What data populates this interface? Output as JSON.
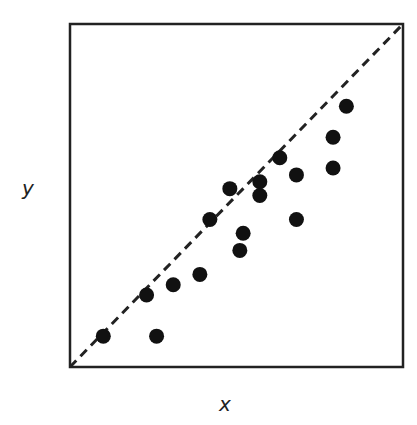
{
  "chart_data": {
    "type": "scatter",
    "title": "",
    "xlabel": "x",
    "ylabel": "y",
    "xlim": [
      0,
      10
    ],
    "ylim": [
      0,
      10
    ],
    "grid": false,
    "ticks": false,
    "reference_line": {
      "style": "dashed",
      "from": [
        0,
        0
      ],
      "to": [
        10,
        10
      ],
      "label": "y = x"
    },
    "points": [
      {
        "x": 1.0,
        "y": 0.9
      },
      {
        "x": 2.6,
        "y": 0.9
      },
      {
        "x": 2.3,
        "y": 2.1
      },
      {
        "x": 3.1,
        "y": 2.4
      },
      {
        "x": 3.9,
        "y": 2.7
      },
      {
        "x": 4.2,
        "y": 4.3
      },
      {
        "x": 4.8,
        "y": 5.2
      },
      {
        "x": 5.1,
        "y": 3.4
      },
      {
        "x": 5.2,
        "y": 3.9
      },
      {
        "x": 5.7,
        "y": 5.4
      },
      {
        "x": 5.7,
        "y": 5.0
      },
      {
        "x": 6.3,
        "y": 6.1
      },
      {
        "x": 6.8,
        "y": 5.6
      },
      {
        "x": 6.8,
        "y": 4.3
      },
      {
        "x": 7.9,
        "y": 6.7
      },
      {
        "x": 7.9,
        "y": 5.8
      },
      {
        "x": 8.3,
        "y": 7.6
      }
    ],
    "colors": {
      "points": "#111111",
      "frame": "#222222",
      "line": "#222222"
    }
  }
}
